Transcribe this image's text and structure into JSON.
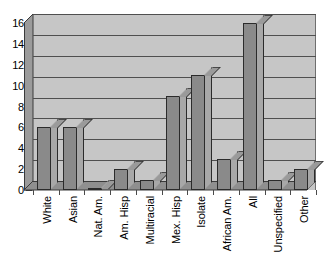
{
  "chart_data": {
    "type": "bar",
    "title": "",
    "subtitle": "",
    "xlabel": "",
    "ylabel": "",
    "categories": [
      "White",
      "Asian",
      "Nat. Am.",
      "Am. Hisp",
      "Multiracial",
      "Mex. Hisp",
      "Isolate",
      "African Am.",
      "All",
      "Unspecified",
      "Other"
    ],
    "values": [
      6,
      6,
      0,
      2,
      1,
      9,
      11,
      3,
      16,
      1,
      2
    ],
    "ylim": [
      0,
      16
    ],
    "ytick_labels": [
      "0",
      "2",
      "4",
      "6",
      "8",
      "10",
      "12",
      "14",
      "16"
    ],
    "ytick_values": [
      0,
      2,
      4,
      6,
      8,
      10,
      12,
      14,
      16
    ],
    "grid": true,
    "grid_axis": "y",
    "legend": false,
    "legend_position": "none",
    "style": "3d-column",
    "colors": {
      "plot_background": "#c6c6c6",
      "bar_face": "#8a8a8a",
      "bar_side": "#a8a8a8",
      "bar_outline": "#2b2b2b",
      "gridline": "#4f4f4f",
      "floor": "#8f8f8f",
      "side_wall": "#9b9b9b",
      "page_background": "#ffffff",
      "text": "#000000"
    }
  }
}
